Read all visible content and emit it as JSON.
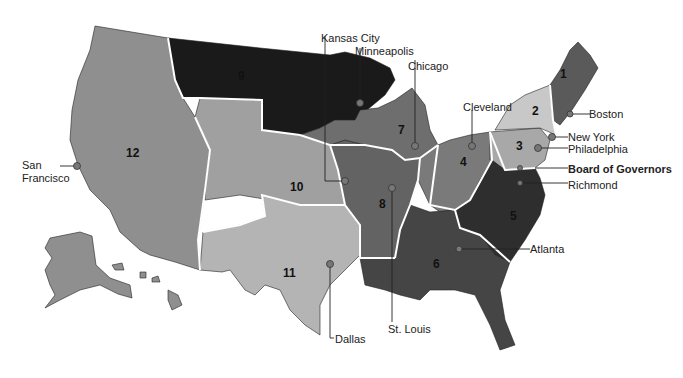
{
  "map": {
    "title": "Federal Reserve Districts",
    "colors": {
      "d1": "#5a5a5a",
      "d2": "#c8c8c8",
      "d3": "#a8a8a8",
      "d4": "#7a7a7a",
      "d5": "#2e2e2e",
      "d6": "#454545",
      "d7": "#6e6e6e",
      "d8": "#636363",
      "d9": "#1a1a1a",
      "d10": "#a0a0a0",
      "d11": "#b4b4b4",
      "d12": "#8f8f8f"
    },
    "districts": [
      {
        "number": "1",
        "bank_city": "Boston"
      },
      {
        "number": "2",
        "bank_city": "New York"
      },
      {
        "number": "3",
        "bank_city": "Philadelphia"
      },
      {
        "number": "4",
        "bank_city": "Cleveland"
      },
      {
        "number": "5",
        "bank_city": "Richmond"
      },
      {
        "number": "6",
        "bank_city": "Atlanta"
      },
      {
        "number": "7",
        "bank_city": "Chicago"
      },
      {
        "number": "8",
        "bank_city": "St. Louis"
      },
      {
        "number": "9",
        "bank_city": "Minneapolis"
      },
      {
        "number": "10",
        "bank_city": "Kansas City"
      },
      {
        "number": "11",
        "bank_city": "Dallas"
      },
      {
        "number": "12",
        "bank_city": "San Francisco"
      }
    ],
    "city_labels": {
      "kansas_city": "Kansas City",
      "minneapolis": "Minneapolis",
      "chicago": "Chicago",
      "cleveland": "Cleveland",
      "boston": "Boston",
      "new_york": "New York",
      "philadelphia": "Philadelphia",
      "board_of_governors": "Board of Governors",
      "richmond": "Richmond",
      "atlanta": "Atlanta",
      "st_louis": "St. Louis",
      "dallas": "Dallas",
      "san_francisco_line1": "San",
      "san_francisco_line2": "Francisco"
    }
  }
}
